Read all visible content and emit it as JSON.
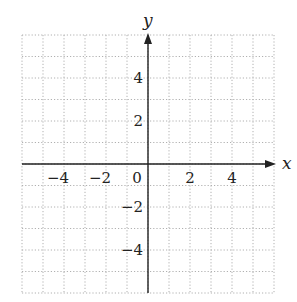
{
  "chart_data": {
    "type": "scatter",
    "title": "",
    "xlabel": "x",
    "ylabel": "y",
    "xlim": [
      -6,
      6
    ],
    "ylim": [
      -6,
      6
    ],
    "grid": true,
    "grid_style": "dotted",
    "grid_step": 1,
    "x_ticks": [
      -4,
      -2,
      0,
      2,
      4
    ],
    "y_ticks": [
      -4,
      -2,
      2,
      4
    ],
    "x_tick_labels": [
      "−4",
      "−2",
      "0",
      "2",
      "4"
    ],
    "y_tick_labels": [
      "−4",
      "−2",
      "2",
      "4"
    ],
    "series": [],
    "legend": null
  },
  "axes": {
    "x_label": "x",
    "y_label": "y",
    "origin_label": "0"
  },
  "colors": {
    "axis": "#222222",
    "grid": "#b0b0b0",
    "text": "#222222",
    "background": "#ffffff"
  }
}
